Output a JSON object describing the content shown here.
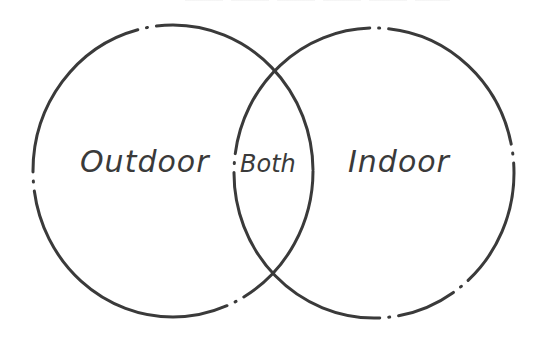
{
  "diagram": {
    "type": "venn",
    "sets": [
      {
        "label": "Outdoor",
        "region": "left-only"
      },
      {
        "label": "Indoor",
        "region": "right-only"
      }
    ],
    "intersection": {
      "label": "Both"
    },
    "labels": {
      "left": "Outdoor",
      "center": "Both",
      "right": "Indoor"
    },
    "colors": {
      "stroke": "#3a3a3a",
      "background": "#ffffff"
    }
  }
}
